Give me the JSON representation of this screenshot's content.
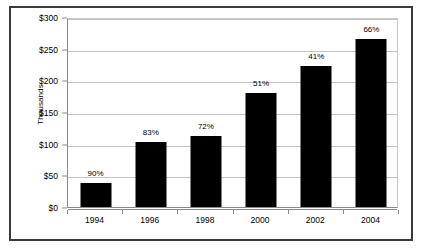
{
  "chart_data": {
    "type": "bar",
    "title": "",
    "subtitle": "",
    "xlabel": "",
    "ylabel": "Thousands",
    "categories": [
      "1994",
      "1996",
      "1998",
      "2000",
      "2002",
      "2004"
    ],
    "values": [
      38,
      102,
      112,
      180,
      223,
      265
    ],
    "data_labels": [
      "90%",
      "83%",
      "72%",
      "51%",
      "41%",
      "66%"
    ],
    "ylim": [
      0,
      300
    ],
    "ytick_values": [
      0,
      50,
      100,
      150,
      200,
      250,
      300
    ],
    "ytick_labels": [
      "$0",
      "$50",
      "$100",
      "$150",
      "$200",
      "$250",
      "$300"
    ],
    "grid": "horizontal",
    "legend": "none",
    "series": [
      {
        "name": "Value",
        "values": [
          38,
          102,
          112,
          180,
          223,
          265
        ],
        "color": "#000000"
      }
    ],
    "colors": {
      "bar": "#000000",
      "gridline": "#c3c3c3",
      "axis": "#8a8a8a",
      "frame": "#3a3a3a",
      "background": "#ffffff",
      "text": "#000000"
    }
  }
}
